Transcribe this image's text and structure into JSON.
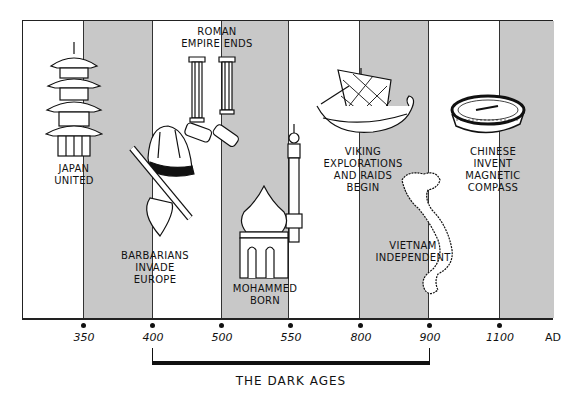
{
  "timeline": {
    "era_suffix": "AD",
    "ticks": [
      {
        "label": "350",
        "x": 83
      },
      {
        "label": "400",
        "x": 152
      },
      {
        "label": "500",
        "x": 221
      },
      {
        "label": "550",
        "x": 290
      },
      {
        "label": "800",
        "x": 360
      },
      {
        "label": "900",
        "x": 429
      },
      {
        "label": "1100",
        "x": 499
      }
    ],
    "shaded_bands": [
      [
        82,
        152
      ],
      [
        220,
        288
      ],
      [
        358,
        428
      ],
      [
        498,
        553
      ]
    ],
    "colors": {
      "band": "#c8c8c8",
      "ink": "#111111",
      "background": "#ffffff"
    }
  },
  "events": [
    {
      "id": "japan",
      "label": "JAPAN\nUNITED",
      "icon": "pagoda-icon"
    },
    {
      "id": "rome",
      "label": "ROMAN\nEMPIRE ENDS",
      "icon": "broken-columns-icon"
    },
    {
      "id": "barbarians",
      "label": "BARBARIANS\nINVADE\nEUROPE",
      "icon": "helmet-axe-icon"
    },
    {
      "id": "mohammed",
      "label": "MOHAMMED\nBORN",
      "icon": "mosque-icon"
    },
    {
      "id": "viking",
      "label": "VIKING\nEXPLORATIONS\nAND RAIDS\nBEGIN",
      "icon": "viking-ship-icon"
    },
    {
      "id": "vietnam",
      "label": "VIETNAM\nINDEPENDENT",
      "icon": "vietnam-map-icon"
    },
    {
      "id": "compass",
      "label": "CHINESE\nINVENT\nMAGNETIC\nCOMPASS",
      "icon": "compass-icon"
    }
  ],
  "period": {
    "label": "THE DARK AGES",
    "start": "400",
    "end": "900"
  }
}
